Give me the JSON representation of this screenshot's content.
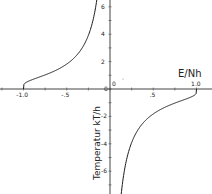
{
  "chart_data": {
    "type": "line",
    "title": "",
    "xlabel": "E/Nh",
    "ylabel": "Temperatur kT/h",
    "xlim": [
      -1.25,
      1.15
    ],
    "ylim": [
      -7,
      7
    ],
    "grid": false,
    "legend": null,
    "x_ticks": [
      {
        "value": -1.0,
        "label": "-1.0"
      },
      {
        "value": -0.5,
        "label": "-.5"
      },
      {
        "value": 0.0,
        "label": "0"
      },
      {
        "value": 0.5,
        "label": ".5"
      },
      {
        "value": 1.0,
        "label": "1.0"
      }
    ],
    "y_ticks": [
      {
        "value": 6,
        "label": "6"
      },
      {
        "value": 4,
        "label": "4"
      },
      {
        "value": 2,
        "label": "2"
      },
      {
        "value": 0,
        "label": "0"
      },
      {
        "value": -2,
        "label": "-2"
      },
      {
        "value": -4,
        "label": "-4"
      },
      {
        "value": -6,
        "label": "-6"
      }
    ],
    "series": [
      {
        "name": "negative energy branch",
        "x": [
          -1.0,
          -0.98,
          -0.9,
          -0.8,
          -0.7,
          -0.6,
          -0.5,
          -0.4,
          -0.3,
          -0.2,
          -0.15,
          -0.1,
          -0.07
        ],
        "y": [
          0.0,
          0.45,
          0.7,
          0.91,
          1.15,
          1.44,
          1.82,
          2.37,
          3.23,
          4.93,
          6.6,
          9.97,
          14.3
        ]
      },
      {
        "name": "positive energy branch",
        "x": [
          0.07,
          0.1,
          0.15,
          0.2,
          0.3,
          0.4,
          0.5,
          0.6,
          0.7,
          0.8,
          0.9,
          0.98,
          1.0
        ],
        "y": [
          -14.3,
          -9.97,
          -6.6,
          -4.93,
          -3.23,
          -2.37,
          -1.82,
          -1.44,
          -1.15,
          -0.91,
          -0.7,
          -0.45,
          0.0
        ]
      }
    ]
  },
  "layout": {
    "origin_px": [
      110,
      89
    ],
    "x_px_per_unit": 86.5,
    "y_px_per_unit": 13.7,
    "line_color": "#1a1a1a",
    "axis_color": "#444444"
  }
}
